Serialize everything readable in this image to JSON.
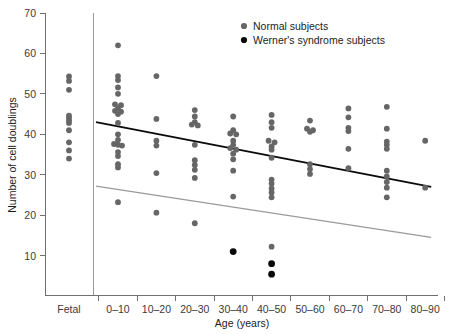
{
  "chart_data": {
    "type": "scatter",
    "title": "",
    "xlabel": "Age (years)",
    "ylabel": "Number of cell doublings",
    "categories": [
      "Fetal",
      "0–10",
      "10–20",
      "20–30",
      "30–40",
      "40–50",
      "50–60",
      "60–70",
      "70–80",
      "80–90"
    ],
    "ytick_labels": [
      "10",
      "20",
      "30",
      "40",
      "50",
      "60",
      "70"
    ],
    "ytick_values": [
      10,
      20,
      30,
      40,
      50,
      60,
      70
    ],
    "ylim": [
      0,
      70
    ],
    "grid": false,
    "legend_position": "top-right",
    "legend": [
      {
        "name": "Normal subjects",
        "marker": "circle",
        "color": "#666666"
      },
      {
        "name": "Werner's syndrome subjects",
        "marker": "circle",
        "color": "#0a0a0a"
      }
    ],
    "series": [
      {
        "name": "Normal subjects",
        "color": "#666666",
        "points": [
          {
            "category": "Fetal",
            "jitter": 0,
            "value": 54.3
          },
          {
            "category": "Fetal",
            "jitter": 0,
            "value": 53.2
          },
          {
            "category": "Fetal",
            "jitter": 0,
            "value": 51.0
          },
          {
            "category": "Fetal",
            "jitter": 0,
            "value": 44.6
          },
          {
            "category": "Fetal",
            "jitter": 0,
            "value": 44.0
          },
          {
            "category": "Fetal",
            "jitter": 0,
            "value": 43.4
          },
          {
            "category": "Fetal",
            "jitter": 0,
            "value": 42.8
          },
          {
            "category": "Fetal",
            "jitter": 0,
            "value": 41.0
          },
          {
            "category": "Fetal",
            "jitter": 0,
            "value": 38.0
          },
          {
            "category": "Fetal",
            "jitter": 0,
            "value": 36.0
          },
          {
            "category": "Fetal",
            "jitter": 0,
            "value": 34.0
          },
          {
            "category": "0–10",
            "jitter": 0,
            "value": 62.0
          },
          {
            "category": "0–10",
            "jitter": 0,
            "value": 54.4
          },
          {
            "category": "0–10",
            "jitter": 0,
            "value": 53.4
          },
          {
            "category": "0–10",
            "jitter": 0,
            "value": 51.6
          },
          {
            "category": "0–10",
            "jitter": 0,
            "value": 50.0
          },
          {
            "category": "0–10",
            "jitter": -3,
            "value": 47.4
          },
          {
            "category": "0–10",
            "jitter": 3,
            "value": 47.2
          },
          {
            "category": "0–10",
            "jitter": 0,
            "value": 46.4
          },
          {
            "category": "0–10",
            "jitter": -3,
            "value": 45.8
          },
          {
            "category": "0–10",
            "jitter": 3,
            "value": 45.6
          },
          {
            "category": "0–10",
            "jitter": 0,
            "value": 45.0
          },
          {
            "category": "0–10",
            "jitter": 0,
            "value": 42.8
          },
          {
            "category": "0–10",
            "jitter": 0,
            "value": 40.0
          },
          {
            "category": "0–10",
            "jitter": 0,
            "value": 38.6
          },
          {
            "category": "0–10",
            "jitter": -4,
            "value": 37.6
          },
          {
            "category": "0–10",
            "jitter": 0,
            "value": 37.4
          },
          {
            "category": "0–10",
            "jitter": 4,
            "value": 37.2
          },
          {
            "category": "0–10",
            "jitter": 0,
            "value": 35.6
          },
          {
            "category": "0–10",
            "jitter": 0,
            "value": 34.6
          },
          {
            "category": "0–10",
            "jitter": 0,
            "value": 32.6
          },
          {
            "category": "0–10",
            "jitter": 0,
            "value": 31.8
          },
          {
            "category": "0–10",
            "jitter": 0,
            "value": 23.2
          },
          {
            "category": "10–20",
            "jitter": 0,
            "value": 54.4
          },
          {
            "category": "10–20",
            "jitter": 0,
            "value": 43.8
          },
          {
            "category": "10–20",
            "jitter": 0,
            "value": 38.4
          },
          {
            "category": "10–20",
            "jitter": 0,
            "value": 37.2
          },
          {
            "category": "10–20",
            "jitter": 0,
            "value": 30.4
          },
          {
            "category": "10–20",
            "jitter": 0,
            "value": 20.6
          },
          {
            "category": "20–30",
            "jitter": 0,
            "value": 46.0
          },
          {
            "category": "20–30",
            "jitter": 0,
            "value": 44.4
          },
          {
            "category": "20–30",
            "jitter": 0,
            "value": 43.0
          },
          {
            "category": "20–30",
            "jitter": -3,
            "value": 42.4
          },
          {
            "category": "20–30",
            "jitter": 3,
            "value": 42.2
          },
          {
            "category": "20–30",
            "jitter": 0,
            "value": 37.4
          },
          {
            "category": "20–30",
            "jitter": 0,
            "value": 33.6
          },
          {
            "category": "20–30",
            "jitter": 0,
            "value": 32.4
          },
          {
            "category": "20–30",
            "jitter": 0,
            "value": 31.2
          },
          {
            "category": "20–30",
            "jitter": 0,
            "value": 29.2
          },
          {
            "category": "20–30",
            "jitter": 0,
            "value": 18.0
          },
          {
            "category": "30–40",
            "jitter": 0,
            "value": 44.4
          },
          {
            "category": "30–40",
            "jitter": 0,
            "value": 41.0
          },
          {
            "category": "30–40",
            "jitter": -3,
            "value": 40.2
          },
          {
            "category": "30–40",
            "jitter": 3,
            "value": 40.0
          },
          {
            "category": "30–40",
            "jitter": 0,
            "value": 38.4
          },
          {
            "category": "30–40",
            "jitter": 0,
            "value": 37.4
          },
          {
            "category": "30–40",
            "jitter": -3,
            "value": 36.6
          },
          {
            "category": "30–40",
            "jitter": 3,
            "value": 36.2
          },
          {
            "category": "30–40",
            "jitter": 0,
            "value": 35.2
          },
          {
            "category": "30–40",
            "jitter": 0,
            "value": 33.8
          },
          {
            "category": "30–40",
            "jitter": 0,
            "value": 31.0
          },
          {
            "category": "30–40",
            "jitter": 0,
            "value": 24.6
          },
          {
            "category": "40–50",
            "jitter": 0,
            "value": 44.8
          },
          {
            "category": "40–50",
            "jitter": 0,
            "value": 43.0
          },
          {
            "category": "40–50",
            "jitter": 0,
            "value": 41.6
          },
          {
            "category": "40–50",
            "jitter": -3,
            "value": 38.4
          },
          {
            "category": "40–50",
            "jitter": 3,
            "value": 38.0
          },
          {
            "category": "40–50",
            "jitter": 0,
            "value": 37.0
          },
          {
            "category": "40–50",
            "jitter": 0,
            "value": 36.2
          },
          {
            "category": "40–50",
            "jitter": 0,
            "value": 34.2
          },
          {
            "category": "40–50",
            "jitter": 0,
            "value": 28.8
          },
          {
            "category": "40–50",
            "jitter": 0,
            "value": 27.8
          },
          {
            "category": "40–50",
            "jitter": 0,
            "value": 26.6
          },
          {
            "category": "40–50",
            "jitter": 0,
            "value": 25.6
          },
          {
            "category": "40–50",
            "jitter": 0,
            "value": 24.4
          },
          {
            "category": "40–50",
            "jitter": 0,
            "value": 12.2
          },
          {
            "category": "50–60",
            "jitter": 0,
            "value": 43.4
          },
          {
            "category": "50–60",
            "jitter": -3,
            "value": 41.4
          },
          {
            "category": "50–60",
            "jitter": 3,
            "value": 41.0
          },
          {
            "category": "50–60",
            "jitter": 0,
            "value": 40.6
          },
          {
            "category": "50–60",
            "jitter": 0,
            "value": 32.6
          },
          {
            "category": "50–60",
            "jitter": 0,
            "value": 31.4
          },
          {
            "category": "50–60",
            "jitter": 0,
            "value": 30.2
          },
          {
            "category": "60–70",
            "jitter": 0,
            "value": 46.4
          },
          {
            "category": "60–70",
            "jitter": 0,
            "value": 44.2
          },
          {
            "category": "60–70",
            "jitter": 0,
            "value": 41.6
          },
          {
            "category": "60–70",
            "jitter": 0,
            "value": 40.8
          },
          {
            "category": "60–70",
            "jitter": 0,
            "value": 36.4
          },
          {
            "category": "60–70",
            "jitter": 0,
            "value": 31.6
          },
          {
            "category": "70–80",
            "jitter": 0,
            "value": 46.8
          },
          {
            "category": "70–80",
            "jitter": 0,
            "value": 41.4
          },
          {
            "category": "70–80",
            "jitter": 0,
            "value": 38.2
          },
          {
            "category": "70–80",
            "jitter": 0,
            "value": 37.4
          },
          {
            "category": "70–80",
            "jitter": 0,
            "value": 36.4
          },
          {
            "category": "70–80",
            "jitter": 0,
            "value": 31.0
          },
          {
            "category": "70–80",
            "jitter": 0,
            "value": 29.6
          },
          {
            "category": "70–80",
            "jitter": 0,
            "value": 28.2
          },
          {
            "category": "70–80",
            "jitter": 0,
            "value": 26.8
          },
          {
            "category": "70–80",
            "jitter": 0,
            "value": 24.4
          },
          {
            "category": "80–90",
            "jitter": 0,
            "value": 38.4
          },
          {
            "category": "80–90",
            "jitter": 0,
            "value": 26.8
          }
        ]
      },
      {
        "name": "Werner's syndrome subjects",
        "color": "#0a0a0a",
        "points": [
          {
            "category": "30–40",
            "jitter": 0,
            "value": 11.0
          },
          {
            "category": "40–50",
            "jitter": 0,
            "value": 8.0
          },
          {
            "category": "40–50",
            "jitter": 0,
            "value": 5.4
          }
        ]
      }
    ],
    "trendlines": [
      {
        "name": "Normal subjects trend",
        "color": "#0a0a0a",
        "x_start_category": "0–10",
        "x_end_category": "80–90",
        "y_start": 43.0,
        "y_end": 27.0
      },
      {
        "name": "Werner's syndrome trend",
        "color": "#9a9a9a",
        "x_start_category": "0–10",
        "x_end_category": "80–90",
        "y_start": 27.2,
        "y_end": 14.5
      }
    ]
  }
}
